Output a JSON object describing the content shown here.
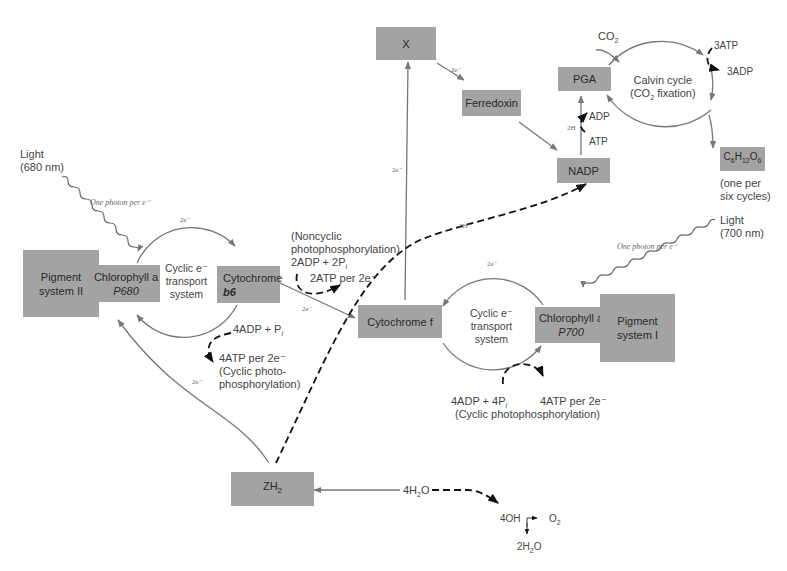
{
  "boxes": {
    "x": "X",
    "ferredoxin": "Ferredoxin",
    "pga": "PGA",
    "nadp": "NADP",
    "glucose": "C6H12O6",
    "ps2": "Pigment system II",
    "chl_p680_l1": "Chlorophyll a",
    "chl_p680_l2": "P680",
    "cytb6_l1": "Cytochrome",
    "cytb6_l2": "b6",
    "cytf": "Cytochrome f",
    "chl_p700_l1": "Chlorophyll a",
    "chl_p700_l2": "P700",
    "ps1": "Pigment system I",
    "zh2": "ZH2"
  },
  "labels": {
    "light680_l1": "Light",
    "light680_l2": "(680 nm)",
    "photon_ps2": "One photon per e⁻",
    "photon_ps1": "One photon per e⁻",
    "light700_l1": "Light",
    "light700_l2": "(700 nm)",
    "cyclic1_l1": "Cyclic e⁻",
    "cyclic1_l2": "transport",
    "cyclic1_l3": "system",
    "cyclic2_l1": "Cyclic e⁻",
    "cyclic2_l2": "transport",
    "cyclic2_l3": "system",
    "twoe_top1": "2e⁻",
    "twoe_top2": "2e⁻",
    "twoe_x": "2e⁻",
    "twoe_ferr": "2e⁻",
    "twoe_cytb6": "2e⁻",
    "twoe_zh2": "2e⁻",
    "twoh_plus": "2H⁺",
    "twoh": "2H",
    "adp_pga": "ADP",
    "atp_pga": "ATP",
    "co2": "CO2",
    "three_atp": "3ATP",
    "three_adp": "3ADP",
    "calvin_l1": "Calvin cycle",
    "calvin_l2": "(CO2 fixation)",
    "glucose_note_l1": "(one per",
    "glucose_note_l2": "six cycles)",
    "noncyclic_l1": "(Noncyclic",
    "noncyclic_l2": "photophosphorylation)",
    "noncyclic_l3": "2ADP + 2Pi",
    "noncyclic_atp": "2ATP per 2e⁻",
    "cyc1_adp": "4ADP + Pi",
    "cyc1_atp": "4ATP per 2e⁻",
    "cyc1_note_l1": "(Cyclic photo-",
    "cyc1_note_l2": "phosphorylation)",
    "cyc2_adp": "4ADP + 4Pi",
    "cyc2_atp": "4ATP per 2e⁻",
    "cyc2_note": "(Cyclic photophosphorylation)",
    "water": "4H2O",
    "oh": "4OH",
    "o2": "O2",
    "water_out": "2H2O"
  },
  "colors": {
    "box_fill": "#a3a3a3",
    "line": "#7a7a7a",
    "dashed": "#1a1a1a"
  }
}
